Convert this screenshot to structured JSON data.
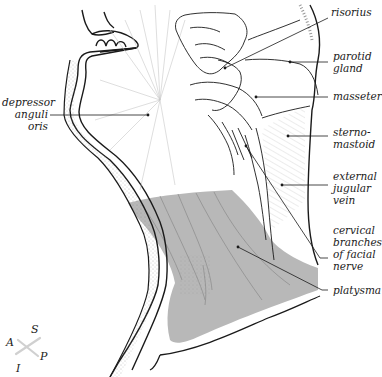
{
  "diagram": {
    "colors": {
      "outline": "#1a1a1a",
      "platysma_fill": "#b8b8b8",
      "muscle_fibers": "#7a7a7a",
      "stipple": "#8a8a8a",
      "background": "#ffffff"
    },
    "labels_right": [
      {
        "id": "risorius",
        "text": "risorius",
        "x": 331,
        "y": 6
      },
      {
        "id": "parotid-gland",
        "text": "parotid\ngland",
        "x": 333,
        "y": 50
      },
      {
        "id": "masseter",
        "text": "masseter",
        "x": 333,
        "y": 90
      },
      {
        "id": "sternomastoid",
        "text": "sterno-\nmastoid",
        "x": 333,
        "y": 126
      },
      {
        "id": "external-jugular-vein",
        "text": "external\njugular\nvein",
        "x": 333,
        "y": 170
      },
      {
        "id": "cervical-branches-facial-nerve",
        "text": "cervical\nbranches\nof facial\nnerve",
        "x": 333,
        "y": 224
      },
      {
        "id": "platysma",
        "text": "platysma",
        "x": 333,
        "y": 287
      }
    ],
    "labels_left": [
      {
        "id": "depressor-anguli-oris",
        "text": "depressor\nanguli\noris",
        "x": 2,
        "y": 98
      }
    ],
    "compass": {
      "superior": "S",
      "inferior": "I",
      "anterior": "A",
      "posterior": "P"
    }
  }
}
